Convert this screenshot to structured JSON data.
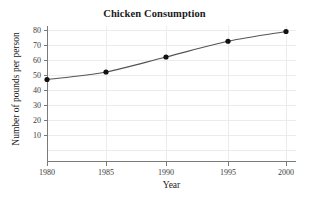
{
  "chart_data": {
    "type": "line",
    "title": "Chicken Consumption",
    "xlabel": "Year",
    "ylabel": "Number of pounds per person",
    "x": [
      1980,
      1985,
      1990,
      1995,
      2000
    ],
    "values": [
      47,
      52,
      62,
      72.5,
      79
    ],
    "xtick_labels": [
      "1980",
      "1985",
      "1990",
      "1995",
      "2000"
    ],
    "ytick_labels": [
      "10",
      "20",
      "30",
      "40",
      "50",
      "60",
      "70",
      "80"
    ],
    "ytick_values": [
      10,
      20,
      30,
      40,
      50,
      60,
      70,
      80
    ],
    "xlim": [
      1980,
      2000
    ],
    "ylim": [
      0,
      85
    ],
    "grid": true,
    "legend": "none",
    "series_color": "#555555",
    "marker_color": "#111111",
    "grid_color": "#ececec",
    "axis_color": "#7a7a7a",
    "background_color": "#ffffff"
  }
}
